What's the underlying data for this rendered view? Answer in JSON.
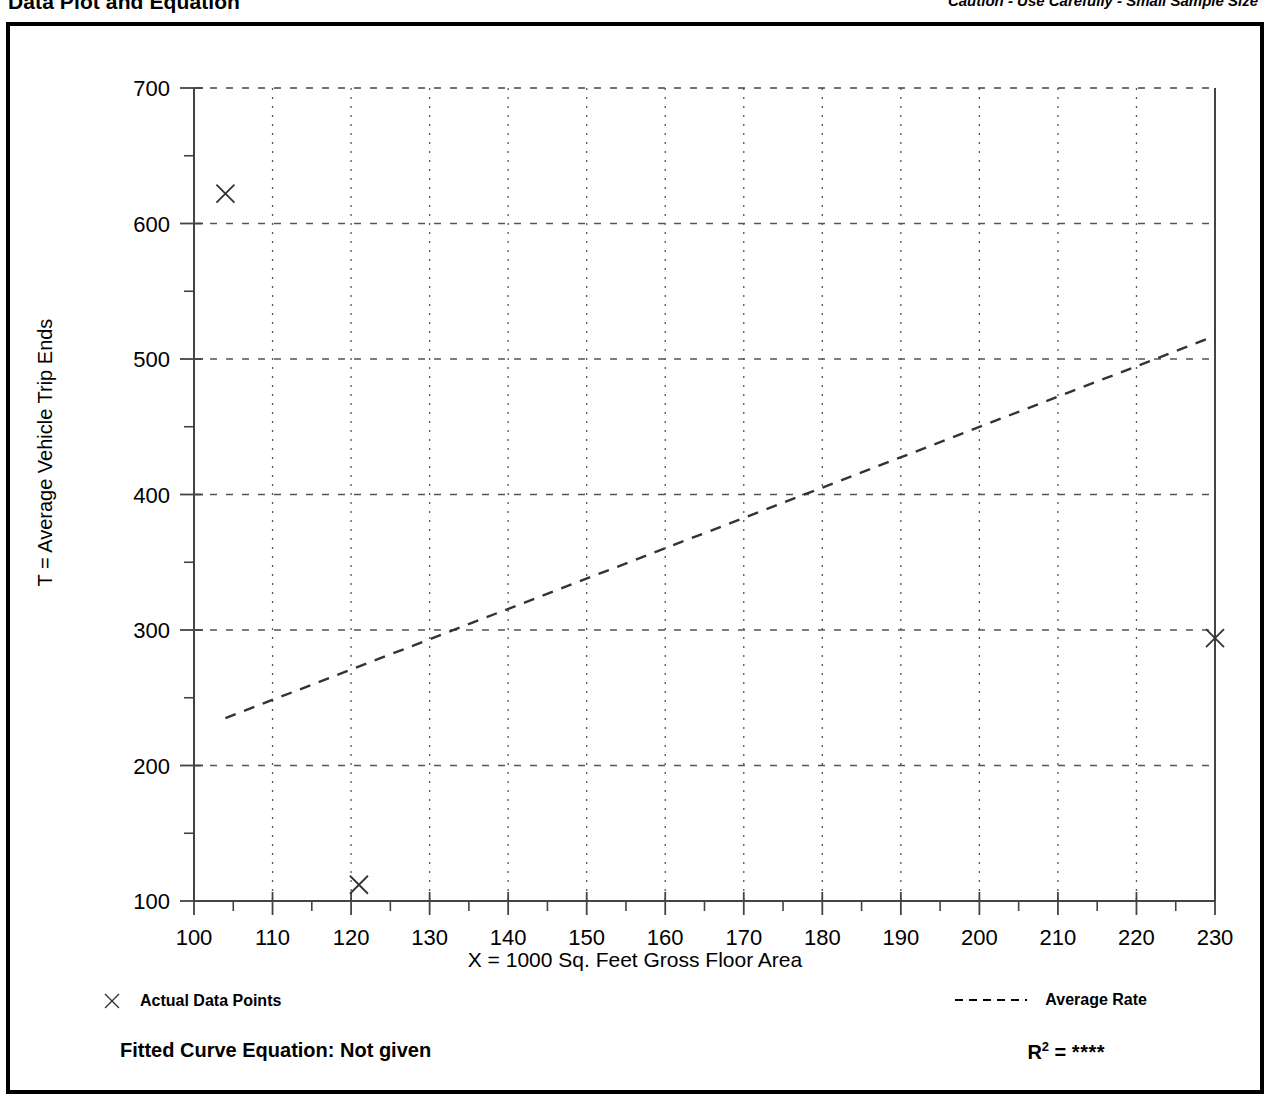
{
  "header": {
    "title": "Data Plot and Equation",
    "caution": "Caution - Use Carefully - Small Sample Size"
  },
  "legend": {
    "points_label": "Actual Data Points",
    "points_marker": "x-marker-icon",
    "rate_label": "Average Rate",
    "rate_marker": "dashed-line-icon"
  },
  "footer": {
    "equation_label": "Fitted Curve Equation:  Not given",
    "r2_symbol": "R",
    "r2_exponent": "2",
    "r2_equals": " = ",
    "r2_value": "****"
  },
  "chart_data": {
    "type": "scatter",
    "title": "Data Plot and Equation",
    "xlabel": "X = 1000 Sq. Feet Gross Floor Area",
    "ylabel": "T = Average Vehicle Trip Ends",
    "xlim": [
      100,
      230
    ],
    "ylim": [
      100,
      700
    ],
    "xticks": [
      100,
      110,
      120,
      130,
      140,
      150,
      160,
      170,
      180,
      190,
      200,
      210,
      220,
      230
    ],
    "yticks": [
      100,
      200,
      300,
      400,
      500,
      600,
      700
    ],
    "yminorticks": [
      150,
      250,
      350,
      450,
      550,
      650
    ],
    "grid": true,
    "legend_position": "below-plot",
    "series": [
      {
        "name": "Actual Data Points",
        "type": "scatter",
        "marker": "x",
        "points": [
          {
            "x": 104,
            "y": 622
          },
          {
            "x": 121,
            "y": 112
          },
          {
            "x": 230,
            "y": 294
          }
        ]
      },
      {
        "name": "Average Rate",
        "type": "line",
        "style": "dashed",
        "points": [
          {
            "x": 104,
            "y": 235
          },
          {
            "x": 230,
            "y": 517
          }
        ]
      }
    ]
  }
}
